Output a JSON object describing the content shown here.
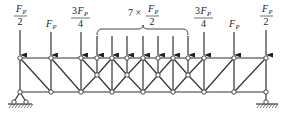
{
  "diagram": {
    "type": "truss-structural-diagram",
    "colors": {
      "line": "#333333",
      "background": "#ffffff",
      "node_fill": "#ffffff"
    },
    "top_chord_y": 58,
    "mid_y": 75,
    "bottom_chord_y": 92,
    "top_nodes_x": [
      20,
      51,
      81,
      97,
      112,
      127,
      143,
      158,
      173,
      188,
      204,
      234,
      266
    ],
    "bottom_nodes_x": [
      20,
      51,
      81,
      112,
      143,
      173,
      204,
      234,
      266
    ],
    "mid_nodes_x": [
      97,
      127,
      158,
      188
    ],
    "loads": [
      {
        "x": 20,
        "label_type": "fraction",
        "num": "F",
        "sub": "P",
        "coef": "",
        "den": "2"
      },
      {
        "x": 51,
        "label_type": "single",
        "num": "F",
        "sub": "P",
        "coef": "",
        "den": ""
      },
      {
        "x": 81,
        "label_type": "fraction",
        "num": "F",
        "sub": "P",
        "coef": "3",
        "den": "4"
      },
      {
        "x": 97,
        "label_type": "grouped"
      },
      {
        "x": 112,
        "label_type": "grouped"
      },
      {
        "x": 127,
        "label_type": "grouped"
      },
      {
        "x": 143,
        "label_type": "grouped"
      },
      {
        "x": 158,
        "label_type": "grouped"
      },
      {
        "x": 173,
        "label_type": "grouped"
      },
      {
        "x": 188,
        "label_type": "grouped"
      },
      {
        "x": 204,
        "label_type": "fraction",
        "num": "F",
        "sub": "P",
        "coef": "3",
        "den": "4"
      },
      {
        "x": 234,
        "label_type": "single",
        "num": "F",
        "sub": "P",
        "coef": "",
        "den": ""
      },
      {
        "x": 266,
        "label_type": "fraction",
        "num": "F",
        "sub": "P",
        "coef": "",
        "den": "2"
      }
    ],
    "group_label": {
      "multiplier": "7 ×",
      "num": "F",
      "sub": "P",
      "den": "2",
      "x_from": 97,
      "x_to": 188
    },
    "labels": {
      "left_half": {
        "main": "F",
        "sub": "P",
        "den": "2"
      },
      "left_full": {
        "main": "F",
        "sub": "P"
      },
      "left_three_quarter": {
        "coef": "3",
        "main": "F",
        "sub": "P",
        "den": "4"
      },
      "group_prefix": "7 ×",
      "group": {
        "main": "F",
        "sub": "P",
        "den": "2"
      },
      "right_three_quarter": {
        "coef": "3",
        "main": "F",
        "sub": "P",
        "den": "4"
      },
      "right_full": {
        "main": "F",
        "sub": "P"
      },
      "right_half": {
        "main": "F",
        "sub": "P",
        "den": "2"
      }
    },
    "supports": {
      "left": {
        "type": "pin",
        "x": 20
      },
      "right": {
        "type": "roller-link",
        "x": 266
      }
    }
  }
}
